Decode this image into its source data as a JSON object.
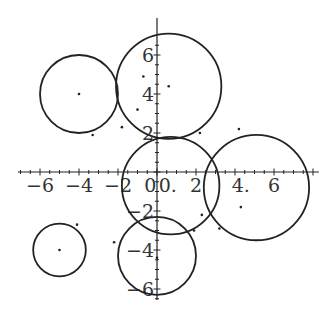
{
  "chart_data": {
    "type": "scatter",
    "title": "",
    "xlabel": "",
    "ylabel": "",
    "xlim": [
      -7.2,
      8.3
    ],
    "ylim": [
      -6.8,
      7.0
    ],
    "grid": false,
    "x_tick_labels": [
      "-6",
      "-4",
      "-2",
      "0",
      "0.",
      "2",
      "4.",
      "6"
    ],
    "y_tick_labels": [
      "6",
      "4",
      "2",
      "-2",
      "-4",
      "-6"
    ],
    "x_ticks": [
      -6,
      -4,
      -2,
      0,
      2,
      4,
      6
    ],
    "y_ticks": [
      -6,
      -4,
      -2,
      2,
      4,
      6
    ],
    "circles": [
      {
        "name": "left",
        "cx": -4.0,
        "cy": 4.0,
        "r": 2.0
      },
      {
        "name": "top",
        "cx": 0.6,
        "cy": 4.4,
        "r": 2.7
      },
      {
        "name": "center",
        "cx": 0.7,
        "cy": -0.7,
        "r": 2.5
      },
      {
        "name": "right",
        "cx": 5.1,
        "cy": -0.8,
        "r": 2.7
      },
      {
        "name": "bottom-left",
        "cx": -5.0,
        "cy": -4.0,
        "r": 1.35
      },
      {
        "name": "bottom",
        "cx": 0.0,
        "cy": -4.3,
        "r": 2.0
      }
    ],
    "points": [
      {
        "x": -4.0,
        "y": 4.0
      },
      {
        "x": -3.3,
        "y": 1.9
      },
      {
        "x": -1.8,
        "y": 2.3
      },
      {
        "x": -1.0,
        "y": 3.2
      },
      {
        "x": -0.7,
        "y": 4.9
      },
      {
        "x": 0.6,
        "y": 4.4
      },
      {
        "x": 2.2,
        "y": 2.0
      },
      {
        "x": 4.2,
        "y": 2.2
      },
      {
        "x": 4.3,
        "y": -1.8
      },
      {
        "x": 2.3,
        "y": -2.2
      },
      {
        "x": 3.2,
        "y": -2.9
      },
      {
        "x": 1.9,
        "y": -3.0
      },
      {
        "x": -5.0,
        "y": -4.0
      },
      {
        "x": -4.1,
        "y": -2.7
      },
      {
        "x": -2.2,
        "y": -3.6
      },
      {
        "x": 0.0,
        "y": -4.4
      }
    ]
  }
}
